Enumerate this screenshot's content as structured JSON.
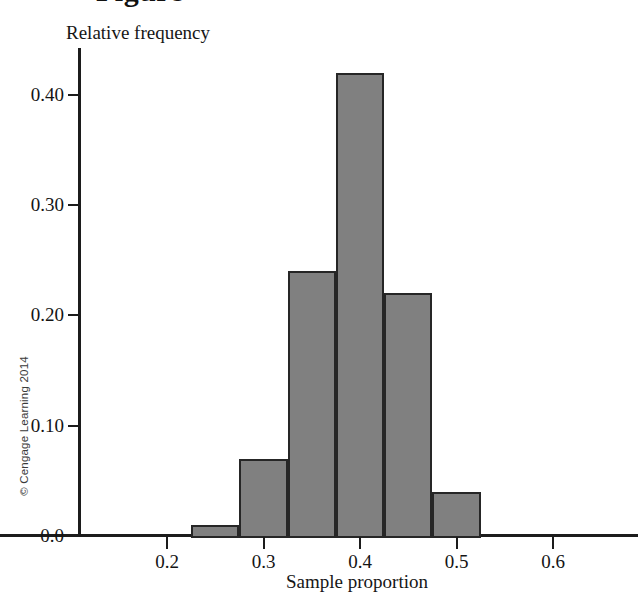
{
  "figure": {
    "clipped_title": "Figure",
    "copyright": "© Cengage Learning 2014"
  },
  "chart_data": {
    "type": "bar",
    "title": "",
    "xlabel": "Sample proportion",
    "ylabel": "Relative frequency",
    "xlim": [
      0.14,
      0.66
    ],
    "ylim": [
      0.0,
      0.445
    ],
    "grid": false,
    "legend": "none",
    "bar_color": "#808080",
    "bar_edge_color": "#262626",
    "axis_color": "#1c1c1c",
    "bin_width": 0.05,
    "bin_edges": [
      0.225,
      0.275,
      0.325,
      0.375,
      0.425,
      0.475,
      0.525
    ],
    "categories": [
      "0.225-0.275",
      "0.275-0.325",
      "0.325-0.375",
      "0.375-0.425",
      "0.425-0.475",
      "0.475-0.525"
    ],
    "bin_centers": [
      0.25,
      0.3,
      0.35,
      0.4,
      0.45,
      0.5
    ],
    "values": [
      0.01,
      0.07,
      0.24,
      0.42,
      0.22,
      0.04
    ],
    "xticks": [
      0.2,
      0.3,
      0.4,
      0.5,
      0.6
    ],
    "xticklabels": [
      "0.2",
      "0.3",
      "0.4",
      "0.5",
      "0.6"
    ],
    "yticks": [
      0.0,
      0.1,
      0.2,
      0.3,
      0.4
    ],
    "yticklabels": [
      "0.0",
      "0.10",
      "0.20",
      "0.30",
      "0.40"
    ]
  },
  "geometry": {
    "x_pixel_at_0_2": 167,
    "x_pixels_per_unit": 965,
    "y_pixel_at_0": 536,
    "y_pixels_per_unit": 1103
  }
}
